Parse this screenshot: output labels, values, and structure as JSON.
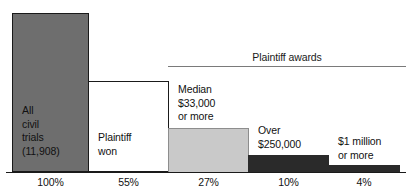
{
  "chart_data": {
    "type": "bar",
    "title": "",
    "subtitle": "",
    "xlabel": "",
    "ylabel": "",
    "grid": false,
    "ylim": [
      0,
      100
    ],
    "orientation": "vertical",
    "legend": "none",
    "categories": [
      "All civil trials (11,908)",
      "Plaintiff won",
      "Median $33,000 or more",
      "Over $250,000",
      "$1 million or more"
    ],
    "values": [
      100,
      55,
      27,
      10,
      4
    ],
    "tick_labels": [
      "100%",
      "55%",
      "27%",
      "10%",
      "4%"
    ],
    "bar_labels": [
      "All\ncivil\ntrials\n(11,908)",
      "Plaintiff\nwon",
      "Median\n$33,000\nor more",
      "Over\n$250,000",
      "$1 million\nor more"
    ],
    "bar_colors": [
      "#6e6e6e",
      "#ffffff",
      "#c9c9c9",
      "#2a2a2a",
      "#2a2a2a"
    ],
    "annotations": [
      {
        "text": "Plaintiff awards",
        "spans_categories": [
          2,
          3,
          4
        ],
        "style": "bracket-above"
      }
    ]
  },
  "annotation": {
    "plaintiff_awards": "Plaintiff awards"
  },
  "colors": {
    "bar_all_trials": "#6e6e6e",
    "bar_plaintiff_won": "#ffffff",
    "bar_median": "#c9c9c9",
    "bar_over_250k": "#2a2a2a",
    "bar_over_1m": "#2a2a2a",
    "axis": "#1a1a1a",
    "bracket": "#7a7a7a",
    "text": "#111111"
  }
}
